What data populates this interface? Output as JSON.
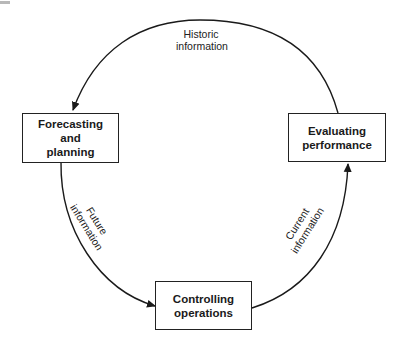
{
  "diagram": {
    "nodes": [
      {
        "id": "forecasting",
        "label": "Forecasting\nand\nplanning"
      },
      {
        "id": "evaluating",
        "label": "Evaluating\nperformance"
      },
      {
        "id": "controlling",
        "label": "Controlling\noperations"
      }
    ],
    "edges": [
      {
        "from": "evaluating",
        "to": "forecasting",
        "label": "Historic\ninformation"
      },
      {
        "from": "forecasting",
        "to": "controlling",
        "label": "Future\ninformation"
      },
      {
        "from": "controlling",
        "to": "evaluating",
        "label": "Current\ninformation"
      }
    ],
    "colors": {
      "line": "#1a1a1a",
      "box_border": "#222222",
      "background": "#ffffff"
    }
  }
}
